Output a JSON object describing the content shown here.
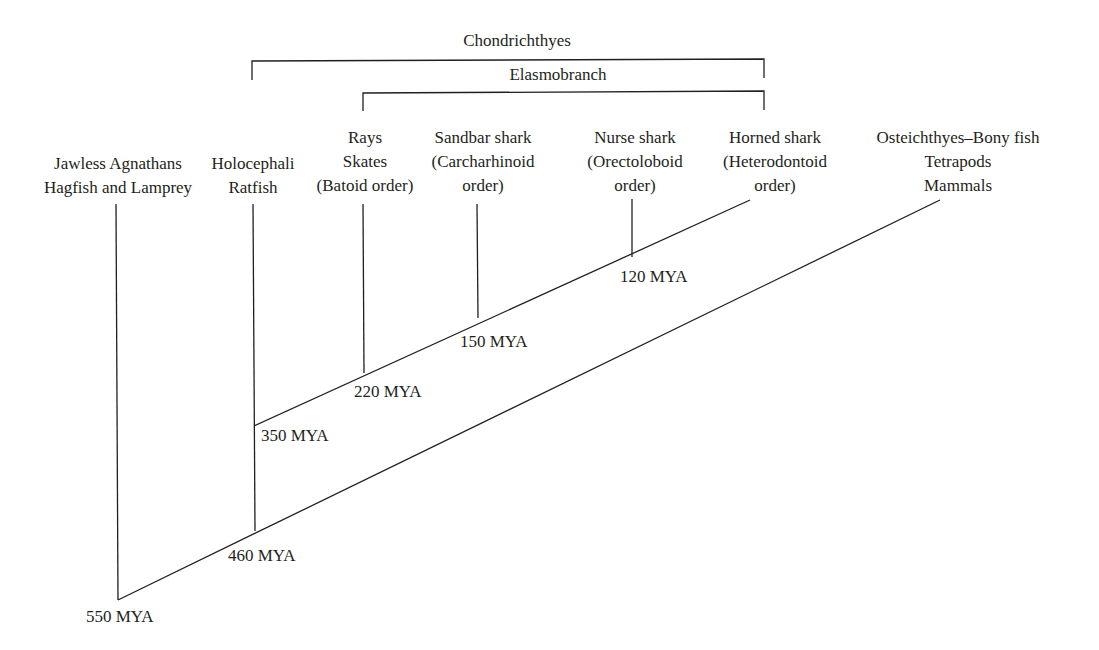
{
  "groups": {
    "chondrichthyes": "Chondrichthyes",
    "elasmobranch": "Elasmobranch"
  },
  "taxa": [
    {
      "lines": [
        "Jawless Agnathans",
        "Hagfish and Lamprey"
      ]
    },
    {
      "lines": [
        "Holocephali",
        "Ratfish"
      ]
    },
    {
      "lines": [
        "Rays",
        "Skates",
        "(Batoid order)"
      ]
    },
    {
      "lines": [
        "Sandbar shark",
        "(Carcharhinoid",
        "order)"
      ]
    },
    {
      "lines": [
        "Nurse shark",
        "(Orectoloboid",
        "order)"
      ]
    },
    {
      "lines": [
        "Horned shark",
        "(Heterodontoid",
        "order)"
      ]
    },
    {
      "lines": [
        "Osteichthyes–Bony fish",
        "Tetrapods",
        "Mammals"
      ]
    }
  ],
  "divergence_times": [
    {
      "label": "550 MYA"
    },
    {
      "label": "460 MYA"
    },
    {
      "label": "350 MYA"
    },
    {
      "label": "220 MYA"
    },
    {
      "label": "150 MYA"
    },
    {
      "label": "120 MYA"
    }
  ],
  "colors": {
    "line": "#231f20",
    "text": "#231f20",
    "background": "#ffffff"
  }
}
